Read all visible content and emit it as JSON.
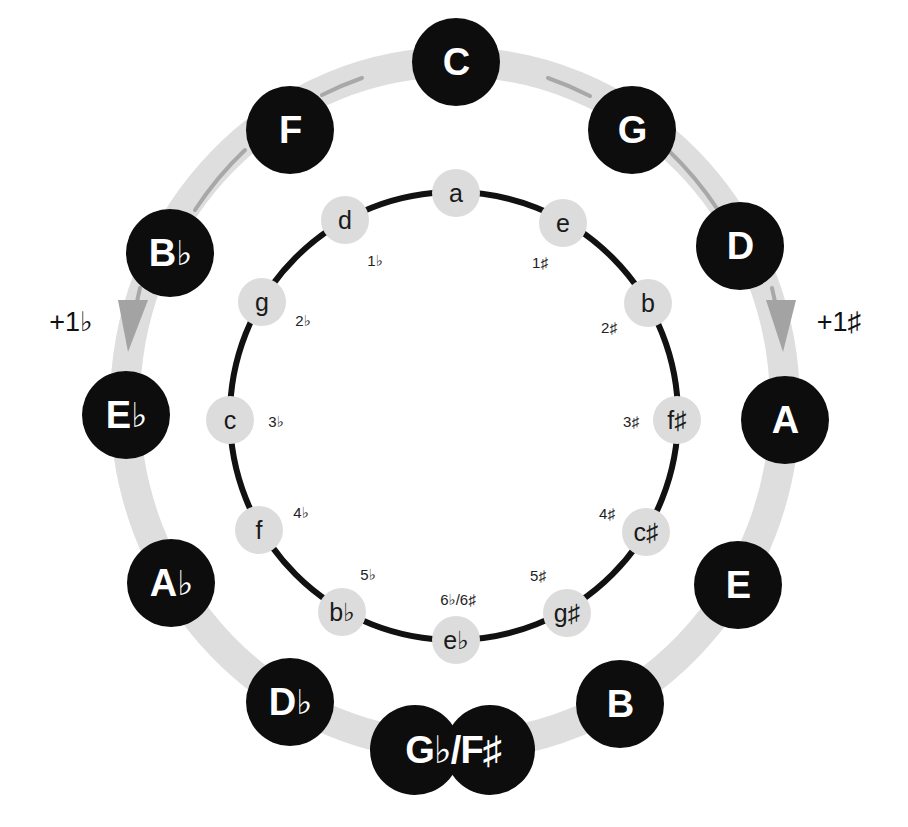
{
  "diagram": {
    "major_keys": [
      {
        "id": "C",
        "label": "C",
        "accidental": ""
      },
      {
        "id": "G",
        "label": "G",
        "accidental": ""
      },
      {
        "id": "D",
        "label": "D",
        "accidental": ""
      },
      {
        "id": "A",
        "label": "A",
        "accidental": ""
      },
      {
        "id": "E",
        "label": "E",
        "accidental": ""
      },
      {
        "id": "B",
        "label": "B",
        "accidental": ""
      },
      {
        "id": "Gb-Fs",
        "label": "G♭/F♯",
        "accidental": ""
      },
      {
        "id": "Db",
        "label": "D",
        "accidental": "♭"
      },
      {
        "id": "Ab",
        "label": "A",
        "accidental": "♭"
      },
      {
        "id": "Eb",
        "label": "E",
        "accidental": "♭"
      },
      {
        "id": "Bb",
        "label": "B",
        "accidental": "♭"
      },
      {
        "id": "F",
        "label": "F",
        "accidental": ""
      }
    ],
    "minor_keys": [
      {
        "id": "a",
        "label": "a"
      },
      {
        "id": "e",
        "label": "e"
      },
      {
        "id": "b",
        "label": "b"
      },
      {
        "id": "fs",
        "label": "f♯"
      },
      {
        "id": "cs",
        "label": "c♯"
      },
      {
        "id": "gs",
        "label": "g♯"
      },
      {
        "id": "eb",
        "label": "e♭"
      },
      {
        "id": "bb",
        "label": "b♭"
      },
      {
        "id": "f",
        "label": "f"
      },
      {
        "id": "c",
        "label": "c"
      },
      {
        "id": "g",
        "label": "g"
      },
      {
        "id": "d",
        "label": "d"
      }
    ],
    "signatures": {
      "s1": "1♯",
      "s2": "2♯",
      "s3": "3♯",
      "s4": "4♯",
      "s5": "5♯",
      "s6": "6♭/6♯",
      "f5": "5♭",
      "f4": "4♭",
      "f3": "3♭",
      "f2": "2♭",
      "f1": "1♭"
    },
    "step_labels": {
      "sharp": "+1♯",
      "flat": "+1♭"
    },
    "colors": {
      "major_fill": "#0d0d0d",
      "major_text": "#ffffff",
      "minor_fill": "#dcdcdc",
      "outer_ring": "#dedede",
      "arrow": "#a8a8a8",
      "inner_ring": "#111111"
    }
  }
}
